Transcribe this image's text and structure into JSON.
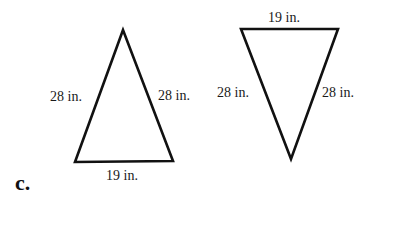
{
  "part_label": "c.",
  "triangles": [
    {
      "name": "upright-triangle",
      "left_side": "28 in.",
      "right_side": "28 in.",
      "base": "19 in."
    },
    {
      "name": "inverted-triangle",
      "left_side": "28 in.",
      "right_side": "28 in.",
      "base": "19 in."
    }
  ],
  "colors": {
    "stroke": "#111111",
    "background": "#ffffff"
  }
}
